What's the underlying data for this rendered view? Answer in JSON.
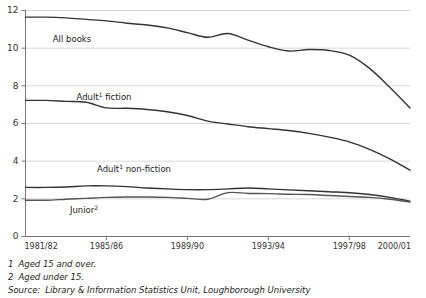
{
  "chart_data": {
    "type": "line",
    "title": "",
    "xlabel": "",
    "ylabel": "",
    "ylim": [
      0,
      12
    ],
    "yticks": [
      0,
      2,
      4,
      6,
      8,
      10,
      12
    ],
    "ytick_labels": [
      "0",
      "2",
      "4",
      "6",
      "8",
      "10",
      "12"
    ],
    "grid": "horizontal",
    "legend": "inline-labels",
    "x": [
      "1981/82",
      "1982/83",
      "1983/84",
      "1984/85",
      "1985/86",
      "1986/87",
      "1987/88",
      "1988/89",
      "1989/90",
      "1990/91",
      "1991/92",
      "1992/93",
      "1993/94",
      "1994/95",
      "1995/96",
      "1996/97",
      "1997/98",
      "1998/99",
      "1999/00",
      "2000/01"
    ],
    "xtick_labels": [
      "1981/82",
      "1985/86",
      "1989/90",
      "1993/94",
      "1997/98",
      "2000/01"
    ],
    "xtick_values": [
      "1981/82",
      "1985/86",
      "1989/90",
      "1993/94",
      "1997/98",
      "2000/01"
    ],
    "series": [
      {
        "name": "All books",
        "label": "All books",
        "color": "#333333",
        "values": [
          11.62,
          11.62,
          11.58,
          11.5,
          11.42,
          11.3,
          11.2,
          11.05,
          10.8,
          10.55,
          10.75,
          10.4,
          10.05,
          9.82,
          9.9,
          9.85,
          9.6,
          8.9,
          7.9,
          6.8
        ]
      },
      {
        "name": "Adult fiction",
        "label": "Adult¹ fiction",
        "label_text": "Adult",
        "label_sup": "1",
        "label_tail": " fiction",
        "color": "#333333",
        "values": [
          7.2,
          7.2,
          7.15,
          7.1,
          6.8,
          6.78,
          6.72,
          6.6,
          6.4,
          6.1,
          5.95,
          5.8,
          5.7,
          5.6,
          5.45,
          5.25,
          5.0,
          4.6,
          4.1,
          3.5
        ]
      },
      {
        "name": "Adult non-fiction",
        "label": "Adult¹ non-fiction",
        "label_text": "Adult",
        "label_sup": "1",
        "label_tail": " non-fiction",
        "color": "#333333",
        "values": [
          2.58,
          2.58,
          2.6,
          2.66,
          2.66,
          2.62,
          2.55,
          2.5,
          2.46,
          2.46,
          2.5,
          2.55,
          2.5,
          2.45,
          2.4,
          2.35,
          2.3,
          2.2,
          2.05,
          1.85
        ]
      },
      {
        "name": "Junior",
        "label": "Junior²",
        "label_text": "Junior",
        "label_sup": "2",
        "label_tail": "",
        "color": "#555555",
        "values": [
          1.9,
          1.9,
          1.95,
          2.0,
          2.05,
          2.07,
          2.07,
          2.05,
          2.0,
          1.95,
          2.3,
          2.26,
          2.25,
          2.22,
          2.2,
          2.15,
          2.1,
          2.05,
          1.95,
          1.8
        ]
      }
    ],
    "inline_labels": [
      {
        "name": "All books",
        "text": "All books",
        "sup": "",
        "tail": "",
        "x": 72,
        "y": 42
      },
      {
        "name": "Adult fiction",
        "text": "Adult",
        "sup": "1",
        "tail": " fiction",
        "x": 104,
        "y": 100
      },
      {
        "name": "Adult non-fiction",
        "text": "Adult",
        "sup": "1",
        "tail": " non-fiction",
        "x": 134,
        "y": 172
      },
      {
        "name": "Junior",
        "text": "Junior",
        "sup": "2",
        "tail": "",
        "x": 84,
        "y": 213
      }
    ]
  },
  "footnotes": [
    {
      "num": "1",
      "text": "Aged 15 and over."
    },
    {
      "num": "2",
      "text": "Aged under 15."
    },
    {
      "num": "Source:",
      "text": "Library & Information Statistics Unit, Loughborough University"
    }
  ],
  "colors": {
    "axis": "#777777",
    "grid": "#d9d9d9",
    "line": "#333333",
    "line_alt": "#555555",
    "text": "#1a1a1a"
  }
}
